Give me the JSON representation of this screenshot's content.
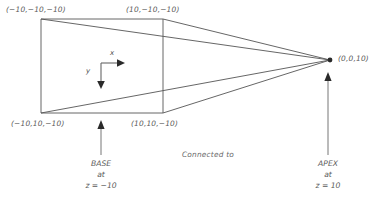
{
  "figure": {
    "type": "3d-perspective-diagram",
    "stroke_color": "#555555",
    "text_color": "#5a5a5a",
    "background_color": "#ffffff"
  },
  "base": {
    "corners": [
      {
        "name": "top-left",
        "label": "(−10,−10,−10)"
      },
      {
        "name": "top-right",
        "label": "(10,−10,−10)"
      },
      {
        "name": "bottom-left",
        "label": "(−10,10,−10)"
      },
      {
        "name": "bottom-right",
        "label": "(10,10,−10)"
      }
    ],
    "annotation": {
      "line1": "BASE",
      "line2": "at",
      "line3": "z = −10"
    }
  },
  "apex": {
    "label": "(0,0,10)",
    "annotation": {
      "line1": "APEX",
      "line2": "at",
      "line3": "z = 10"
    }
  },
  "connector": {
    "label": "Connected to"
  },
  "axes": {
    "x_label": "x",
    "y_label": "y"
  }
}
